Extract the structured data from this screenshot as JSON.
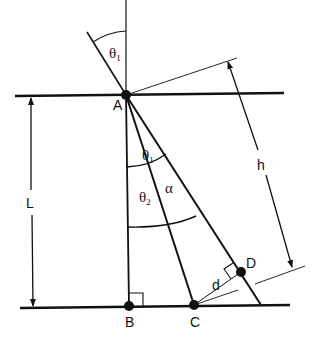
{
  "diagram": {
    "type": "geometry-refraction-figure",
    "colors": {
      "ink": "#111111",
      "background": "#ffffff"
    },
    "points": {
      "A": {
        "label": "A"
      },
      "B": {
        "label": "B"
      },
      "C": {
        "label": "C"
      },
      "D": {
        "label": "D"
      }
    },
    "angles": {
      "incident": {
        "symbol": "θ",
        "subscript": "1"
      },
      "inner_theta1": {
        "symbol": "θ",
        "subscript": "1"
      },
      "theta2": {
        "symbol": "θ",
        "subscript": "2"
      },
      "alpha": {
        "symbol": "α"
      }
    },
    "dimensions": {
      "L": {
        "label": "L"
      },
      "h": {
        "label": "h"
      },
      "d": {
        "label": "d"
      }
    }
  }
}
